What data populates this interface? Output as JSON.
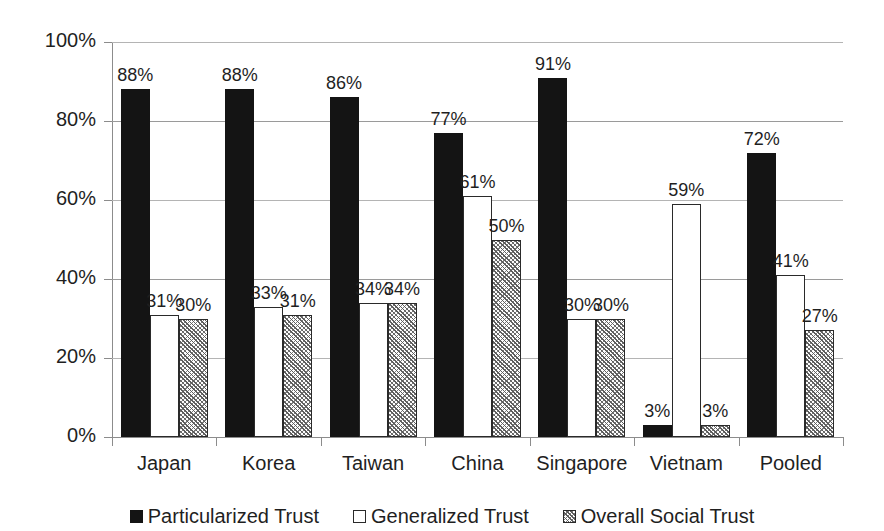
{
  "chart_data": {
    "type": "bar",
    "title": "",
    "subtitle": "",
    "xlabel": "",
    "ylabel": "",
    "ylim": [
      0,
      100
    ],
    "ytick_labels": [
      "0%",
      "20%",
      "40%",
      "60%",
      "80%",
      "100%"
    ],
    "ytick_values": [
      0,
      20,
      40,
      60,
      80,
      100
    ],
    "grid": true,
    "grid_axis": "y",
    "legend_position": "bottom",
    "value_label_suffix": "%",
    "categories": [
      "Japan",
      "Korea",
      "Taiwan",
      "China",
      "Singapore",
      "Vietnam",
      "Pooled"
    ],
    "series": [
      {
        "name": "Particularized Trust",
        "fill": "solid-black",
        "color": "#141414",
        "values": [
          88,
          88,
          86,
          77,
          91,
          3,
          72
        ],
        "labels": [
          "88%",
          "88%",
          "86%",
          "77%",
          "91%",
          "3%",
          "72%"
        ]
      },
      {
        "name": "Generalized Trust",
        "fill": "hollow-white",
        "color": "#ffffff",
        "values": [
          31,
          33,
          34,
          61,
          30,
          59,
          41
        ],
        "labels": [
          "31%",
          "33%",
          "34%",
          "61%",
          "30%",
          "59%",
          "41%"
        ]
      },
      {
        "name": "Overall Social Trust",
        "fill": "diagonal-hatch",
        "color": "#6e6e6e",
        "values": [
          30,
          31,
          34,
          50,
          30,
          3,
          27
        ],
        "labels": [
          "30%",
          "31%",
          "34%",
          "50%",
          "30%",
          "3%",
          "27%"
        ]
      }
    ]
  },
  "legend": {
    "items": [
      {
        "label": "Particularized Trust"
      },
      {
        "label": "Generalized Trust"
      },
      {
        "label": "Overall Social Trust"
      }
    ]
  },
  "colors": {
    "background": "#ffffff",
    "text": "#1f1f1f",
    "axis": "#8c8c8c",
    "gridline": "#9a9a9a",
    "series_solid": "#141414",
    "series_hollow": "#ffffff",
    "series_hatch": "#6e6e6e"
  }
}
